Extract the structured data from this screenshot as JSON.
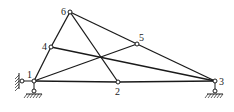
{
  "diagram": {
    "type": "truss",
    "nodes": [
      {
        "id": "1",
        "label": "1",
        "x": 34,
        "y": 81
      },
      {
        "id": "2",
        "label": "2",
        "x": 118,
        "y": 82
      },
      {
        "id": "3",
        "label": "3",
        "x": 215,
        "y": 81
      },
      {
        "id": "4",
        "label": "4",
        "x": 51,
        "y": 47
      },
      {
        "id": "5",
        "label": "5",
        "x": 137,
        "y": 44
      },
      {
        "id": "6",
        "label": "6",
        "x": 70,
        "y": 12
      }
    ],
    "members": [
      [
        "1",
        "2"
      ],
      [
        "2",
        "3"
      ],
      [
        "1",
        "4"
      ],
      [
        "4",
        "6"
      ],
      [
        "6",
        "5"
      ],
      [
        "5",
        "3"
      ],
      [
        "6",
        "2"
      ],
      [
        "4",
        "3"
      ],
      [
        "1",
        "5"
      ]
    ],
    "supports": [
      {
        "node": "1",
        "type": "fixed-pin",
        "label": "left support"
      },
      {
        "node": "3",
        "type": "pin",
        "label": "right support"
      }
    ]
  }
}
